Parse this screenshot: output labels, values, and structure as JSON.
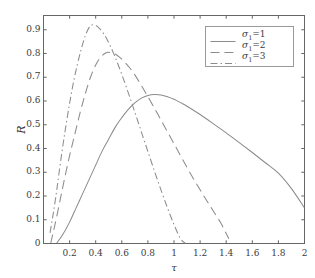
{
  "figure": {
    "background_color": "#ffffff",
    "axes_color": "#666666",
    "line_color": "#8c8c8c",
    "text_color": "#3d3d3d"
  },
  "axis": {
    "x_label": "τ",
    "y_label": "R",
    "x_ticks": [
      "0.2",
      "0.4",
      "0.6",
      "0.8",
      "1",
      "1.2",
      "1.4",
      "1.6",
      "1.8",
      "2"
    ],
    "y_ticks": [
      "0",
      "0.1",
      "0.2",
      "0.3",
      "0.4",
      "0.5",
      "0.6",
      "0.7",
      "0.8",
      "0.9"
    ]
  },
  "legend": {
    "entries": [
      {
        "label": "σ₁=1",
        "sigma": "σ",
        "sub": "1",
        "eq": "=1",
        "style": "solid"
      },
      {
        "label": "σ₁=2",
        "sigma": "σ",
        "sub": "1",
        "eq": "=2",
        "style": "dashed"
      },
      {
        "label": "σ₁=3",
        "sigma": "σ",
        "sub": "1",
        "eq": "=3",
        "style": "dashdot"
      }
    ]
  },
  "chart_data": {
    "type": "line",
    "title": "",
    "xlabel": "τ",
    "ylabel": "R",
    "xlim": [
      0,
      2
    ],
    "ylim": [
      0,
      0.96
    ],
    "grid": false,
    "legend_position": "upper right",
    "series": [
      {
        "name": "σ₁=1",
        "style": "solid",
        "x": [
          0.1,
          0.15,
          0.2,
          0.25,
          0.3,
          0.35,
          0.4,
          0.45,
          0.5,
          0.55,
          0.6,
          0.65,
          0.7,
          0.75,
          0.8,
          0.85,
          0.9,
          0.95,
          1.0,
          1.05,
          1.1,
          1.2,
          1.3,
          1.4,
          1.5,
          1.6,
          1.7,
          1.8,
          1.9,
          2.0
        ],
        "y": [
          0.0,
          0.04,
          0.09,
          0.15,
          0.21,
          0.27,
          0.33,
          0.39,
          0.44,
          0.49,
          0.53,
          0.565,
          0.592,
          0.612,
          0.623,
          0.627,
          0.625,
          0.618,
          0.607,
          0.593,
          0.578,
          0.543,
          0.505,
          0.466,
          0.425,
          0.383,
          0.34,
          0.296,
          0.231,
          0.15
        ]
      },
      {
        "name": "σ₁=2",
        "style": "dashed",
        "x": [
          0.055,
          0.08,
          0.1,
          0.13,
          0.16,
          0.2,
          0.24,
          0.28,
          0.32,
          0.36,
          0.4,
          0.44,
          0.48,
          0.5,
          0.54,
          0.58,
          0.62,
          0.66,
          0.7,
          0.75,
          0.8,
          0.85,
          0.9,
          0.95,
          1.0,
          1.05,
          1.1,
          1.15,
          1.2,
          1.25,
          1.3,
          1.36,
          1.42
        ],
        "y": [
          0.0,
          0.06,
          0.11,
          0.19,
          0.27,
          0.37,
          0.46,
          0.55,
          0.63,
          0.7,
          0.752,
          0.786,
          0.803,
          0.805,
          0.8,
          0.786,
          0.765,
          0.74,
          0.71,
          0.665,
          0.618,
          0.57,
          0.52,
          0.47,
          0.42,
          0.37,
          0.32,
          0.272,
          0.226,
          0.181,
          0.138,
          0.085,
          0.02
        ]
      },
      {
        "name": "σ₁=3",
        "style": "dashdot",
        "x": [
          0.05,
          0.07,
          0.09,
          0.11,
          0.14,
          0.17,
          0.2,
          0.23,
          0.26,
          0.29,
          0.32,
          0.35,
          0.37,
          0.4,
          0.43,
          0.46,
          0.49,
          0.52,
          0.56,
          0.6,
          0.64,
          0.68,
          0.72,
          0.76,
          0.8,
          0.85,
          0.9,
          0.95,
          1.0,
          1.05,
          1.09
        ],
        "y": [
          0.045,
          0.11,
          0.18,
          0.26,
          0.38,
          0.49,
          0.59,
          0.68,
          0.755,
          0.82,
          0.875,
          0.91,
          0.92,
          0.918,
          0.905,
          0.884,
          0.856,
          0.822,
          0.77,
          0.712,
          0.65,
          0.586,
          0.52,
          0.453,
          0.387,
          0.305,
          0.226,
          0.15,
          0.08,
          0.02,
          0.0
        ]
      }
    ],
    "peaks": [
      {
        "name": "σ₁=1",
        "tau": 0.83,
        "R": 0.627
      },
      {
        "name": "σ₁=2",
        "tau": 0.5,
        "R": 0.805
      },
      {
        "name": "σ₁=3",
        "tau": 0.37,
        "R": 0.92
      }
    ]
  }
}
